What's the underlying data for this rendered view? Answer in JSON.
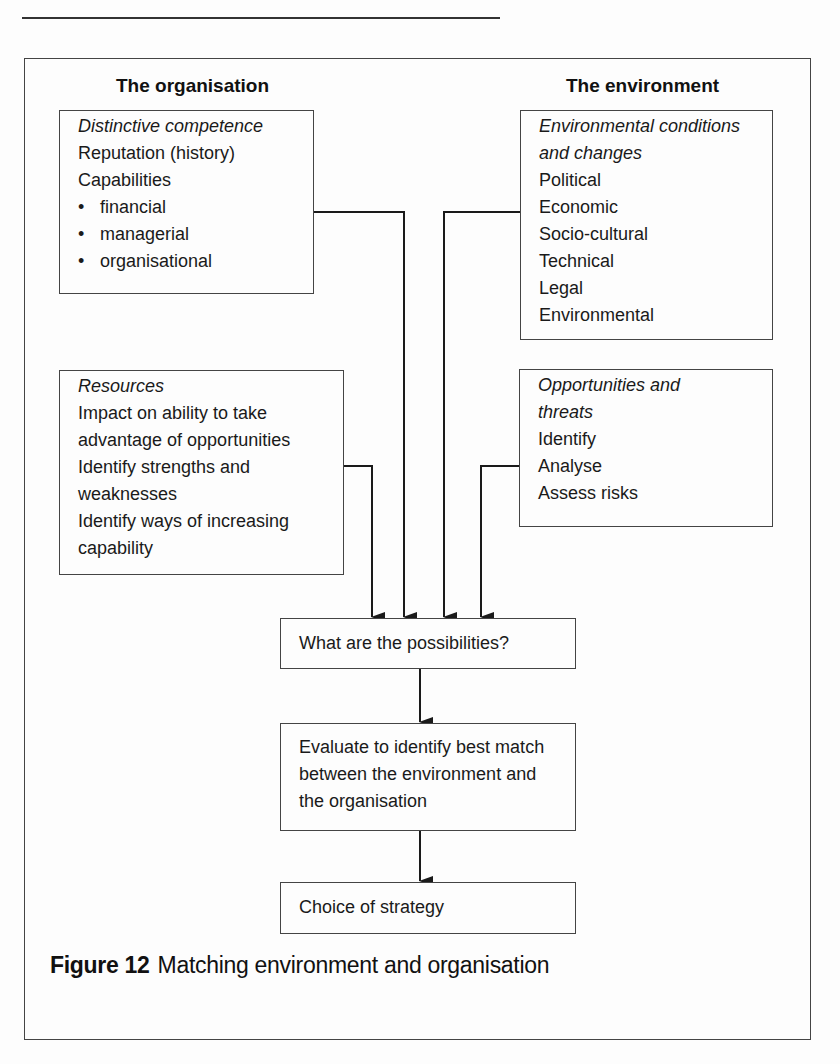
{
  "page": {
    "header_rule": true
  },
  "columns": {
    "left_heading": "The organisation",
    "right_heading": "The environment"
  },
  "boxes": {
    "distinctive_competence": {
      "title": "Distinctive competence",
      "lines": [
        "Reputation (history)",
        "Capabilities"
      ],
      "bullets": [
        "financial",
        "managerial",
        "organisational"
      ]
    },
    "environmental_conditions": {
      "title_lines": [
        "Environmental conditions",
        "and changes"
      ],
      "lines": [
        "Political",
        "Economic",
        "Socio-cultural",
        "Technical",
        "Legal",
        "Environmental"
      ]
    },
    "resources": {
      "title": "Resources",
      "lines": [
        "Impact on ability to take",
        "advantage of opportunities",
        "Identify strengths and",
        "weaknesses",
        "Identify ways of increasing",
        "capability"
      ]
    },
    "opportunities_threats": {
      "title_lines": [
        "Opportunities and",
        "threats"
      ],
      "lines": [
        "Identify",
        "Analyse",
        "Assess risks"
      ]
    },
    "possibilities": {
      "lines": [
        "What are the possibilities?"
      ]
    },
    "evaluate": {
      "lines": [
        "Evaluate to identify best match",
        "between the environment and",
        "the organisation"
      ]
    },
    "choice": {
      "lines": [
        "Choice of strategy"
      ]
    }
  },
  "caption": {
    "figure_label": "Figure 12",
    "text": "Matching environment and organisation"
  },
  "colors": {
    "line": "#1a1a1a",
    "border": "#444444",
    "background": "#fdfdfd"
  }
}
